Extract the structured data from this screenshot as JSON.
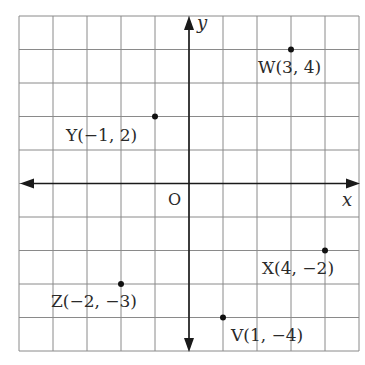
{
  "chart_data": {
    "type": "scatter",
    "title": "",
    "xlabel": "x",
    "ylabel": "y",
    "origin_label": "O",
    "xlim": [
      -5,
      5
    ],
    "ylim": [
      -5,
      5
    ],
    "grid": true,
    "grid_step": 1,
    "points": [
      {
        "name": "W",
        "x": 3,
        "y": 4,
        "label": "W(3, 4)",
        "label_pos": "below"
      },
      {
        "name": "Y",
        "x": -1,
        "y": 2,
        "label": "Y(−1, 2)",
        "label_pos": "below-left"
      },
      {
        "name": "X",
        "x": 4,
        "y": -2,
        "label": "X(4, −2)",
        "label_pos": "below"
      },
      {
        "name": "Z",
        "x": -2,
        "y": -3,
        "label": "Z(−2, −3)",
        "label_pos": "below"
      },
      {
        "name": "V",
        "x": 1,
        "y": -4,
        "label": "V(1, −4)",
        "label_pos": "below-right"
      }
    ]
  }
}
